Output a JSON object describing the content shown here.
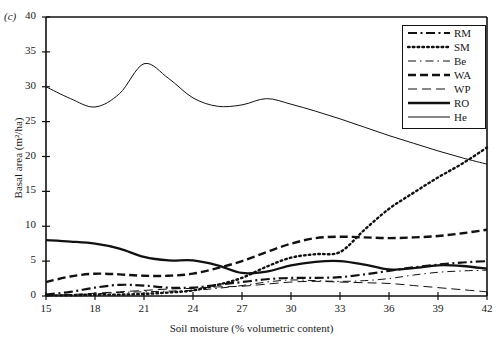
{
  "figure": {
    "panel_label": "(c)",
    "xlabel": "Soil moisture (% volumetric content)",
    "ylabel": "Basal area (m²/ha)"
  },
  "axes": {
    "x_ticks": [
      15,
      18,
      21,
      24,
      27,
      30,
      33,
      36,
      39,
      42
    ],
    "y_ticks": [
      0,
      5,
      10,
      15,
      20,
      25,
      30,
      35,
      40
    ],
    "xlim": [
      15,
      42
    ],
    "ylim": [
      0,
      40
    ]
  },
  "legend": {
    "position": "top-right",
    "entries": [
      {
        "label": "RM",
        "style": "thick-dash-dot",
        "color": "#111111"
      },
      {
        "label": "SM",
        "style": "thick-dotted",
        "color": "#111111"
      },
      {
        "label": "Be",
        "style": "thin-dash-dot",
        "color": "#111111"
      },
      {
        "label": "WA",
        "style": "thick-dashed",
        "color": "#111111"
      },
      {
        "label": "WP",
        "style": "thin-dashed",
        "color": "#111111"
      },
      {
        "label": "RO",
        "style": "thick-solid",
        "color": "#111111"
      },
      {
        "label": "He",
        "style": "thin-solid",
        "color": "#111111"
      }
    ]
  },
  "chart_data": {
    "type": "line",
    "title": "",
    "subtitle": "",
    "panel": "(c)",
    "xlabel": "Soil moisture (% volumetric content)",
    "ylabel": "Basal area (m²/ha)",
    "xlim": [
      15,
      42
    ],
    "ylim": [
      0,
      40
    ],
    "xticks": [
      15,
      18,
      21,
      24,
      27,
      30,
      33,
      36,
      39,
      42
    ],
    "yticks": [
      0,
      5,
      10,
      15,
      20,
      25,
      30,
      35,
      40
    ],
    "grid": false,
    "legend_position": "top-right",
    "x": [
      15,
      16.5,
      18,
      19.5,
      21,
      22.5,
      24,
      25.5,
      27,
      28.5,
      30,
      31.5,
      33,
      34.5,
      36,
      37.5,
      39,
      40.5,
      42
    ],
    "series": [
      {
        "name": "RM",
        "label": "Red maple",
        "style": "thick-dash-dot",
        "values": [
          0.2,
          0.6,
          1.2,
          1.6,
          1.5,
          1.2,
          1.2,
          1.6,
          2.0,
          2.4,
          2.6,
          2.6,
          2.7,
          3.1,
          3.6,
          4.1,
          4.5,
          4.8,
          5.0
        ]
      },
      {
        "name": "SM",
        "label": "Sugar maple",
        "style": "thick-dotted",
        "values": [
          0.1,
          0.1,
          0.2,
          0.2,
          0.3,
          0.5,
          0.8,
          1.6,
          2.6,
          4.2,
          5.5,
          6.0,
          6.3,
          9.5,
          12.5,
          14.8,
          17.0,
          19.0,
          21.3
        ]
      },
      {
        "name": "Be",
        "label": "Beech",
        "style": "thin-dash-dot",
        "values": [
          0.1,
          0.2,
          0.3,
          0.5,
          0.6,
          0.7,
          0.8,
          1.1,
          1.5,
          2.0,
          2.3,
          2.2,
          2.1,
          2.2,
          2.5,
          3.0,
          3.4,
          3.6,
          3.7
        ]
      },
      {
        "name": "WA",
        "label": "White ash",
        "style": "thick-dashed",
        "values": [
          2.0,
          2.8,
          3.2,
          3.1,
          2.9,
          2.9,
          3.2,
          4.0,
          5.0,
          6.3,
          7.5,
          8.3,
          8.5,
          8.4,
          8.3,
          8.4,
          8.6,
          9.0,
          9.5
        ]
      },
      {
        "name": "WP",
        "label": "White pine",
        "style": "thin-dashed",
        "values": [
          0.1,
          0.2,
          0.4,
          0.6,
          0.8,
          1.0,
          1.1,
          1.3,
          1.4,
          1.7,
          2.0,
          2.1,
          2.0,
          1.9,
          1.8,
          1.5,
          1.2,
          0.9,
          0.6
        ]
      },
      {
        "name": "RO",
        "label": "Red oak",
        "style": "thick-solid",
        "values": [
          8.0,
          7.8,
          7.5,
          6.8,
          5.6,
          5.1,
          5.1,
          4.4,
          3.3,
          3.5,
          4.4,
          4.9,
          5.0,
          4.5,
          3.8,
          4.0,
          4.4,
          4.3,
          3.9
        ]
      },
      {
        "name": "He",
        "label": "Hemlock",
        "style": "thin-solid",
        "values": [
          30.0,
          28.3,
          27.1,
          29.0,
          33.3,
          31.2,
          28.4,
          27.2,
          27.4,
          28.3,
          27.5,
          26.5,
          25.4,
          24.2,
          23.0,
          21.9,
          20.8,
          19.8,
          18.9
        ]
      }
    ]
  }
}
